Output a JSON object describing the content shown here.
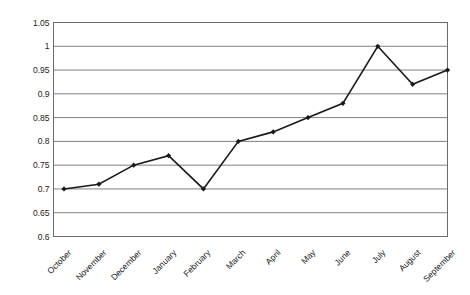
{
  "chart_data": {
    "type": "line",
    "title": "",
    "subtitle": "",
    "xlabel": "",
    "ylabel": "",
    "categories": [
      "October",
      "November",
      "December",
      "January",
      "February",
      "March",
      "April",
      "May",
      "June",
      "July",
      "August",
      "September"
    ],
    "values": [
      0.7,
      0.71,
      0.75,
      0.77,
      0.7,
      0.8,
      0.82,
      0.85,
      0.88,
      1,
      0.92,
      0.95
    ],
    "series": [
      {
        "name": "",
        "values": [
          0.7,
          0.71,
          0.75,
          0.77,
          0.7,
          0.8,
          0.82,
          0.85,
          0.88,
          1,
          0.92,
          0.95
        ]
      }
    ],
    "ylim": [
      0.6,
      1.05
    ],
    "ytick_values": [
      0.6,
      0.65,
      0.7,
      0.75,
      0.8,
      0.85,
      0.9,
      0.95,
      1,
      1.05
    ],
    "ytick_labels": [
      "0.6",
      "0.65",
      "0.7",
      "0.75",
      "0.8",
      "0.85",
      "0.9",
      "0.95",
      "1",
      "1.05"
    ],
    "grid": "horizontal",
    "legend": "none",
    "marker": "diamond",
    "line_color": "#1a1a1a",
    "marker_color": "#1a1a1a",
    "grid_color": "#808080",
    "axis_color": "#6b6b6b",
    "background_color": "#ffffff",
    "xtick_label_rotation": -45
  }
}
